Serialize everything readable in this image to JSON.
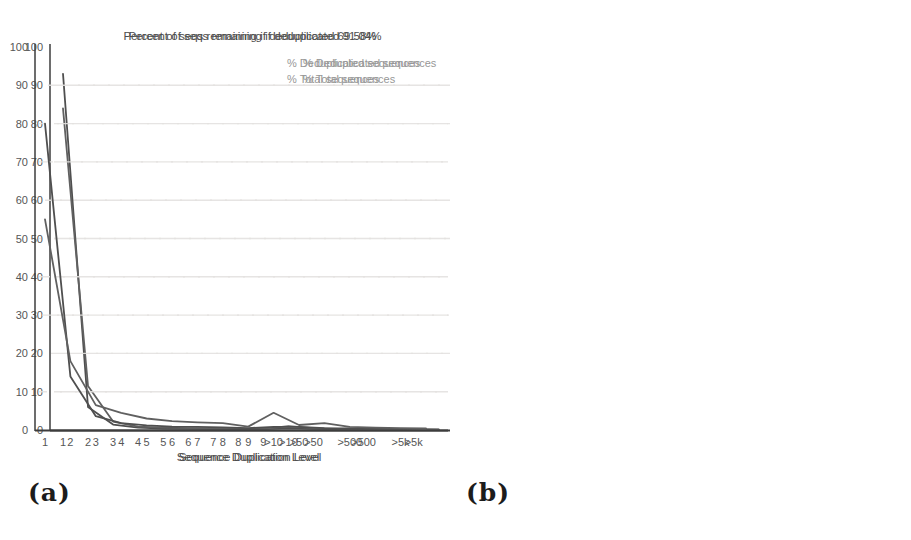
{
  "figure": {
    "caption_a": "(a)",
    "caption_b": "(b)"
  },
  "colors": {
    "background": "#ffffff",
    "axis": "#3d3d3d",
    "grid": "#e4e2e0",
    "title_text": "#4d4d4d",
    "tick_text": "#565656",
    "legend_text": "#979797",
    "series_deduplicated": "#4f4f4f",
    "series_total": "#606060"
  },
  "chart_data": [
    {
      "type": "line",
      "panel": "a",
      "title": "Percent of seqs remaining if deduplicated 91.04%",
      "xlabel": "Sequence Duplication Level",
      "ylim": [
        0,
        100
      ],
      "yticks": [
        0,
        10,
        20,
        30,
        40,
        50,
        60,
        70,
        80,
        90,
        100
      ],
      "grid": "horizontal-dashed",
      "legend_position": "top-right-inside",
      "categories": [
        "1",
        "2",
        "3",
        "4",
        "5",
        "6",
        "7",
        "8",
        "9",
        ">10",
        ">50",
        "",
        ">500",
        "",
        ">5k",
        ""
      ],
      "series": [
        {
          "name": "% Deduplicated sequences",
          "color": "#4f4f4f",
          "values": [
            93,
            6,
            1.4,
            0.6,
            0.4,
            0.3,
            0.25,
            0.2,
            0.2,
            0.5,
            0.3,
            0.2,
            0.25,
            0.15,
            0.15,
            0.1
          ]
        },
        {
          "name": "% Total sequences",
          "color": "#606060",
          "values": [
            84,
            11.5,
            2.2,
            0.9,
            0.6,
            0.5,
            0.4,
            0.35,
            0.3,
            1.0,
            0.5,
            0.3,
            0.4,
            0.2,
            0.2,
            0.15
          ]
        }
      ]
    },
    {
      "type": "line",
      "panel": "b",
      "title": "Percent of seqs remaining if deduplicated 69.58%",
      "xlabel": "Sequence Duplication Level",
      "ylim": [
        0,
        100
      ],
      "yticks": [
        0,
        10,
        20,
        30,
        40,
        50,
        60,
        70,
        80,
        90,
        100
      ],
      "grid": "horizontal-dashed",
      "legend_position": "top-right-inside",
      "categories": [
        "1",
        "2",
        "3",
        "4",
        "5",
        "6",
        "7",
        "8",
        "9",
        ">10",
        ">50",
        "",
        ">500",
        "",
        ">5k",
        ""
      ],
      "series": [
        {
          "name": "% Deduplicated sequences",
          "color": "#4f4f4f",
          "values": [
            80,
            14,
            3.6,
            1.8,
            1.2,
            0.9,
            0.8,
            0.7,
            0.5,
            0.8,
            0.8,
            0.5,
            0.4,
            0.3,
            0.3,
            0.2
          ]
        },
        {
          "name": "% Total sequences",
          "color": "#606060",
          "values": [
            55,
            18,
            6.5,
            4.5,
            3.0,
            2.3,
            2.0,
            1.8,
            0.9,
            4.5,
            1.3,
            1.8,
            0.8,
            0.6,
            0.5,
            0.4
          ]
        }
      ]
    }
  ]
}
